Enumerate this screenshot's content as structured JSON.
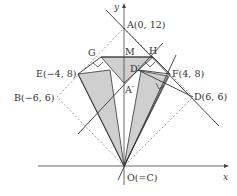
{
  "axes": {
    "x_label": "x",
    "y_label": "y"
  },
  "points": {
    "A": "A(0, 12)",
    "B": "B(−6, 6)",
    "D": "D(6, 6)",
    "E": "E(−4, 8)",
    "F": "F(4, 8)",
    "G": "G",
    "H": "H",
    "M": "M",
    "A_prime": "A′",
    "D_prime": "D′",
    "O": "O(=C)"
  },
  "colors": {
    "shade": "#cfcfcf",
    "line": "#333333",
    "dash": "#777777"
  }
}
